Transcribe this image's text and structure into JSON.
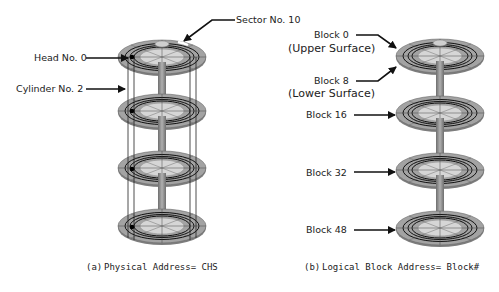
{
  "left_diagram": {
    "labels": {
      "sector": "Sector No. 10",
      "head": "Head No. 0",
      "cylinder": "Cylinder No. 2"
    },
    "caption_prefix": "(a)",
    "caption": "Physical Address= CHS",
    "platter_count": 4
  },
  "right_diagram": {
    "labels": {
      "block0": "Block 0",
      "upper_surface": "(Upper Surface)",
      "block8": "Block 8",
      "lower_surface": "(Lower Surface)",
      "block16": "Block 16",
      "block32": "Block 32",
      "block48": "Block 48"
    },
    "caption_prefix": "(b)",
    "caption": "Logical Block Address= Block#",
    "platter_count": 4
  },
  "colors": {
    "platter_outer": "#9a9a9a",
    "platter_inner": "#d4d4d4",
    "spindle": "#8c8c8c",
    "track_line": "#111111",
    "arrow": "#111111"
  }
}
